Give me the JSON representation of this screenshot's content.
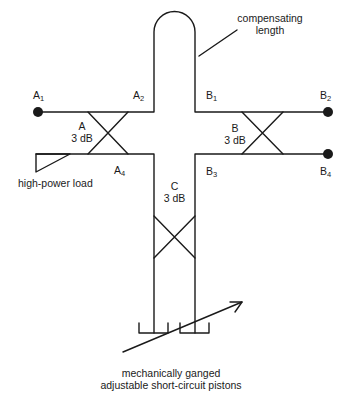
{
  "diagram": {
    "type": "waveguide hybrid network schematic",
    "ports": [
      {
        "id": "A1",
        "letter": "A",
        "sub": "1"
      },
      {
        "id": "A2",
        "letter": "A",
        "sub": "2"
      },
      {
        "id": "A4",
        "letter": "A",
        "sub": "4"
      },
      {
        "id": "B1",
        "letter": "B",
        "sub": "1"
      },
      {
        "id": "B2",
        "letter": "B",
        "sub": "2"
      },
      {
        "id": "B3",
        "letter": "B",
        "sub": "3"
      },
      {
        "id": "B4",
        "letter": "B",
        "sub": "4"
      }
    ],
    "couplers": [
      {
        "name": "A",
        "rating": "3 dB"
      },
      {
        "name": "B",
        "rating": "3 dB"
      },
      {
        "name": "C",
        "rating": "3 dB"
      }
    ],
    "annotations": {
      "compensating_line1": "compensating",
      "compensating_line2": "length",
      "load": "high-power load",
      "pistons_line1": "mechanically ganged",
      "pistons_line2": "adjustable short-circuit pistons"
    },
    "colors": {
      "line": "#1a1a1a",
      "background": "#ffffff"
    }
  }
}
